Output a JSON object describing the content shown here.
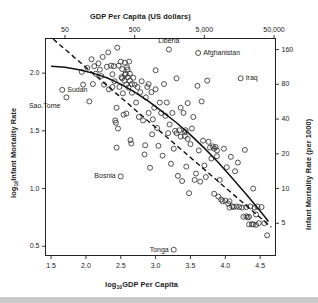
{
  "figure": {
    "top_axis_title": "GDP Per Capita (US dollars)",
    "bottom_axis_title_main": "GDP Per Capita",
    "bottom_axis_title_prefix": "log",
    "bottom_axis_title_sub": "10",
    "left_axis_title_main": "Infant Mortality Rate",
    "left_axis_title_prefix": "log",
    "left_axis_title_sub": "10",
    "right_axis_title": "Infant Mortality Rate (per 1000)"
  },
  "chart_data": {
    "type": "scatter",
    "title": "",
    "xlabel": "log10GDP Per Capita",
    "ylabel": "log10Infant Mortality Rate",
    "xlim": [
      1.42,
      4.72
    ],
    "ylim": [
      0.42,
      2.3
    ],
    "grid": false,
    "legend": "none",
    "axes": {
      "bottom": {
        "label": "log10GDP Per Capita",
        "ticks": [
          1.5,
          2.0,
          2.5,
          3.0,
          3.5,
          4.0,
          4.5
        ],
        "ticklabels": [
          "1.5",
          "2.0",
          "2.5",
          "3.0",
          "3.5",
          "4.0",
          "4.5"
        ]
      },
      "top": {
        "label": "GDP Per Capita (US dollars)",
        "ticks": [
          1.699,
          2.699,
          3.699,
          4.699
        ],
        "ticklabels": [
          "50",
          "500",
          "5,000",
          "50,000"
        ]
      },
      "left": {
        "label": "log10Infant Mortality Rate",
        "ticks": [
          0.5,
          1.0,
          1.5,
          2.0
        ],
        "ticklabels": [
          "0.5",
          "1.0",
          "1.5",
          "2.0"
        ]
      },
      "right": {
        "label": "Infant Mortality Rate (per 1000)",
        "ticks": [
          0.699,
          1.0,
          1.301,
          1.602,
          1.903,
          2.204
        ],
        "ticklabels": [
          "5",
          "10",
          "20",
          "40",
          "80",
          "160"
        ]
      }
    },
    "annotations": [
      {
        "text": "Liberia",
        "x": 3.19,
        "y": 2.205,
        "side": "above"
      },
      {
        "text": "Afghanistan",
        "x": 3.61,
        "y": 2.175,
        "side": "right"
      },
      {
        "text": "Iraq",
        "x": 4.22,
        "y": 1.955,
        "side": "right"
      },
      {
        "text": "Iraq",
        "x": 4.22,
        "y": 1.955,
        "side": "right"
      },
      {
        "text": "Sudan",
        "x": 1.66,
        "y": 1.855,
        "side": "right"
      },
      {
        "text": "Sao.Tome",
        "x": 1.72,
        "y": 1.79,
        "side": "below-left"
      },
      {
        "text": "Bosnia",
        "x": 2.5,
        "y": 1.105,
        "side": "left"
      },
      {
        "text": "Tonga",
        "x": 3.26,
        "y": 0.47,
        "side": "left"
      }
    ],
    "series": [
      {
        "name": "countries",
        "marker": "open-circle",
        "points": [
          [
            1.66,
            1.855
          ],
          [
            1.72,
            1.79
          ],
          [
            1.94,
            2.01
          ],
          [
            1.96,
            1.9
          ],
          [
            2.02,
            2.045
          ],
          [
            2.05,
            1.755
          ],
          [
            2.08,
            2.12
          ],
          [
            2.1,
            1.905
          ],
          [
            2.12,
            2.06
          ],
          [
            2.14,
            1.995
          ],
          [
            2.18,
            2.085
          ],
          [
            2.2,
            2.03
          ],
          [
            2.22,
            1.975
          ],
          [
            2.24,
            2.14
          ],
          [
            2.26,
            1.9
          ],
          [
            2.3,
            2.055
          ],
          [
            2.32,
            2.18
          ],
          [
            2.33,
            1.86
          ],
          [
            2.36,
            2.065
          ],
          [
            2.38,
            1.99
          ],
          [
            2.4,
            2.06
          ],
          [
            2.41,
            1.93
          ],
          [
            2.42,
            1.59
          ],
          [
            2.43,
            1.57
          ],
          [
            2.44,
            1.355
          ],
          [
            2.45,
            2.22
          ],
          [
            2.46,
            1.52
          ],
          [
            2.47,
            2.065
          ],
          [
            2.48,
            1.88
          ],
          [
            2.5,
            1.105
          ],
          [
            2.5,
            2.1
          ],
          [
            2.51,
            1.965
          ],
          [
            2.52,
            2.035
          ],
          [
            2.53,
            1.825
          ],
          [
            2.54,
            1.64
          ],
          [
            2.55,
            1.935
          ],
          [
            2.56,
            2.09
          ],
          [
            2.57,
            1.995
          ],
          [
            2.58,
            1.9
          ],
          [
            2.58,
            1.65
          ],
          [
            2.59,
            2.05
          ],
          [
            2.6,
            1.965
          ],
          [
            2.61,
            1.875
          ],
          [
            2.62,
            2.1
          ],
          [
            2.63,
            1.935
          ],
          [
            2.64,
            1.42
          ],
          [
            2.65,
            1.39
          ],
          [
            2.66,
            1.83
          ],
          [
            2.68,
            1.96
          ],
          [
            2.7,
            1.9
          ],
          [
            2.72,
            1.745
          ],
          [
            2.74,
            1.88
          ],
          [
            2.76,
            1.62
          ],
          [
            2.78,
            1.835
          ],
          [
            2.8,
            1.93
          ],
          [
            2.82,
            1.59
          ],
          [
            2.84,
            1.295
          ],
          [
            2.85,
            1.375
          ],
          [
            2.86,
            1.79
          ],
          [
            2.88,
            1.88
          ],
          [
            2.9,
            1.655
          ],
          [
            2.92,
            1.18
          ],
          [
            2.94,
            1.835
          ],
          [
            2.95,
            1.47
          ],
          [
            2.96,
            1.6
          ],
          [
            2.98,
            1.7
          ],
          [
            3.0,
            2.025
          ],
          [
            3.0,
            1.86
          ],
          [
            3.02,
            1.525
          ],
          [
            3.04,
            1.37
          ],
          [
            3.06,
            1.745
          ],
          [
            3.08,
            1.655
          ],
          [
            3.1,
            1.285
          ],
          [
            3.12,
            1.905
          ],
          [
            3.14,
            1.63
          ],
          [
            3.16,
            1.745
          ],
          [
            3.18,
            1.48
          ],
          [
            3.19,
            2.205
          ],
          [
            3.2,
            1.555
          ],
          [
            3.22,
            1.215
          ],
          [
            3.24,
            1.655
          ],
          [
            3.26,
            0.47
          ],
          [
            3.26,
            1.345
          ],
          [
            3.28,
            1.5
          ],
          [
            3.3,
            1.955
          ],
          [
            3.32,
            1.11
          ],
          [
            3.34,
            1.505
          ],
          [
            3.36,
            1.7
          ],
          [
            3.38,
            1.065
          ],
          [
            3.4,
            1.655
          ],
          [
            3.42,
            1.49
          ],
          [
            3.43,
            1.505
          ],
          [
            3.44,
            1.19
          ],
          [
            3.46,
            1.74
          ],
          [
            3.48,
            0.96
          ],
          [
            3.5,
            1.385
          ],
          [
            3.52,
            1.52
          ],
          [
            3.54,
            1.62
          ],
          [
            3.56,
            1.075
          ],
          [
            3.58,
            1.13
          ],
          [
            3.6,
            1.89
          ],
          [
            3.61,
            2.175
          ],
          [
            3.62,
            1.33
          ],
          [
            3.64,
            1.06
          ],
          [
            3.66,
            1.755
          ],
          [
            3.68,
            1.415
          ],
          [
            3.7,
            1.2
          ],
          [
            3.72,
            1.1
          ],
          [
            3.74,
            1.935
          ],
          [
            3.76,
            1.405
          ],
          [
            3.78,
            1.355
          ],
          [
            3.8,
            1.26
          ],
          [
            3.82,
            1.365
          ],
          [
            3.84,
            0.955
          ],
          [
            3.86,
            1.36
          ],
          [
            3.88,
            1.28
          ],
          [
            3.9,
            0.93
          ],
          [
            3.92,
            1.075
          ],
          [
            3.94,
            0.905
          ],
          [
            3.96,
            0.89
          ],
          [
            3.98,
            1.345
          ],
          [
            4.0,
            0.895
          ],
          [
            4.02,
            1.185
          ],
          [
            4.04,
            0.87
          ],
          [
            4.06,
            0.835
          ],
          [
            4.08,
            1.275
          ],
          [
            4.1,
            0.845
          ],
          [
            4.12,
            0.84
          ],
          [
            4.14,
            1.15
          ],
          [
            4.16,
            0.845
          ],
          [
            4.18,
            1.225
          ],
          [
            4.2,
            0.84
          ],
          [
            4.22,
            1.955
          ],
          [
            4.24,
            0.835
          ],
          [
            4.26,
            0.755
          ],
          [
            4.28,
            1.335
          ],
          [
            4.3,
            0.84
          ],
          [
            4.32,
            0.75
          ],
          [
            4.34,
            0.69
          ],
          [
            4.36,
            0.845
          ],
          [
            4.38,
            0.69
          ],
          [
            4.4,
            1.0
          ],
          [
            4.42,
            0.835
          ],
          [
            4.44,
            0.775
          ],
          [
            4.46,
            0.845
          ],
          [
            4.48,
            0.7
          ],
          [
            4.52,
            0.84
          ],
          [
            4.56,
            0.7
          ],
          [
            4.6,
            0.595
          ],
          [
            2.56,
            1.985
          ],
          [
            2.6,
            2.03
          ],
          [
            2.63,
            1.995
          ],
          [
            2.66,
            1.905
          ],
          [
            2.52,
            1.955
          ],
          [
            3.3,
            1.48
          ],
          [
            3.36,
            1.45
          ],
          [
            3.42,
            1.455
          ],
          [
            3.46,
            1.43
          ],
          [
            2.9,
            1.905
          ],
          [
            2.38,
            1.88
          ],
          [
            2.44,
            1.7
          ],
          [
            3.84,
            1.345
          ],
          [
            3.88,
            1.33
          ],
          [
            4.06,
            0.89
          ],
          [
            4.3,
            0.76
          ],
          [
            4.34,
            0.755
          ],
          [
            4.4,
            0.69
          ],
          [
            4.44,
            0.685
          ]
        ]
      }
    ],
    "fits": [
      {
        "name": "smooth-fit",
        "style": "solid",
        "points": [
          [
            1.5,
            2.06
          ],
          [
            1.7,
            2.05
          ],
          [
            1.9,
            2.03
          ],
          [
            2.1,
            2.0
          ],
          [
            2.3,
            1.96
          ],
          [
            2.5,
            1.905
          ],
          [
            2.7,
            1.835
          ],
          [
            2.9,
            1.755
          ],
          [
            3.1,
            1.665
          ],
          [
            3.3,
            1.57
          ],
          [
            3.5,
            1.465
          ],
          [
            3.7,
            1.35
          ],
          [
            3.9,
            1.225
          ],
          [
            4.1,
            1.09
          ],
          [
            4.3,
            0.95
          ],
          [
            4.5,
            0.805
          ],
          [
            4.62,
            0.715
          ]
        ]
      },
      {
        "name": "linear-fit",
        "style": "dashed",
        "points": [
          [
            1.53,
            2.295
          ],
          [
            4.66,
            0.665
          ]
        ]
      }
    ]
  }
}
